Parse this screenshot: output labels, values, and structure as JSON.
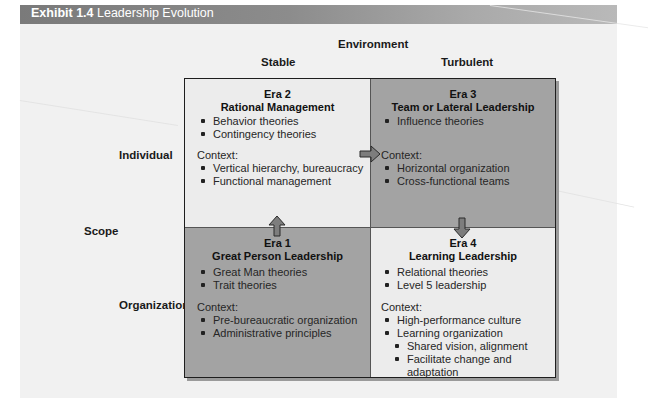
{
  "exhibit": {
    "number_label": "Exhibit 1.4",
    "title": "Leadership Evolution"
  },
  "axes": {
    "environment_label": "Environment",
    "environment_values": [
      "Stable",
      "Turbulent"
    ],
    "scope_label": "Scope",
    "scope_values": [
      "Individual",
      "Organization"
    ]
  },
  "colors": {
    "light_cell": "#ececec",
    "dark_cell": "#a3a3a3",
    "header_bar": "#7a7a7a"
  },
  "eras": [
    {
      "era": "Era 1",
      "name": "Great Person Leadership",
      "position": "organization-stable",
      "theories": [
        "Great Man theories",
        "Trait theories"
      ],
      "context_label": "Context:",
      "context": [
        "Pre-bureaucratic organization",
        "Administrative principles"
      ]
    },
    {
      "era": "Era 2",
      "name": "Rational Management",
      "position": "individual-stable",
      "theories": [
        "Behavior theories",
        "Contingency theories"
      ],
      "context_label": "Context:",
      "context": [
        "Vertical hierarchy, bureaucracy",
        "Functional management"
      ]
    },
    {
      "era": "Era 3",
      "name": "Team or Lateral Leadership",
      "position": "individual-turbulent",
      "theories": [
        "Influence theories"
      ],
      "context_label": "Context:",
      "context": [
        "Horizontal organization",
        "Cross-functional teams"
      ]
    },
    {
      "era": "Era 4",
      "name": "Learning Leadership",
      "position": "organization-turbulent",
      "theories": [
        "Relational theories",
        "Level 5 leadership"
      ],
      "context_label": "Context:",
      "context": [
        "High-performance culture",
        "Learning organization"
      ],
      "context_sub": [
        "Shared vision, alignment",
        "Facilitate change and adaptation"
      ]
    }
  ],
  "arrows": [
    {
      "from": "Era 1",
      "to": "Era 2",
      "direction": "up",
      "icon": "arrow-up-icon"
    },
    {
      "from": "Era 2",
      "to": "Era 3",
      "direction": "right",
      "icon": "arrow-right-icon"
    },
    {
      "from": "Era 3",
      "to": "Era 4",
      "direction": "down",
      "icon": "arrow-down-icon"
    }
  ]
}
